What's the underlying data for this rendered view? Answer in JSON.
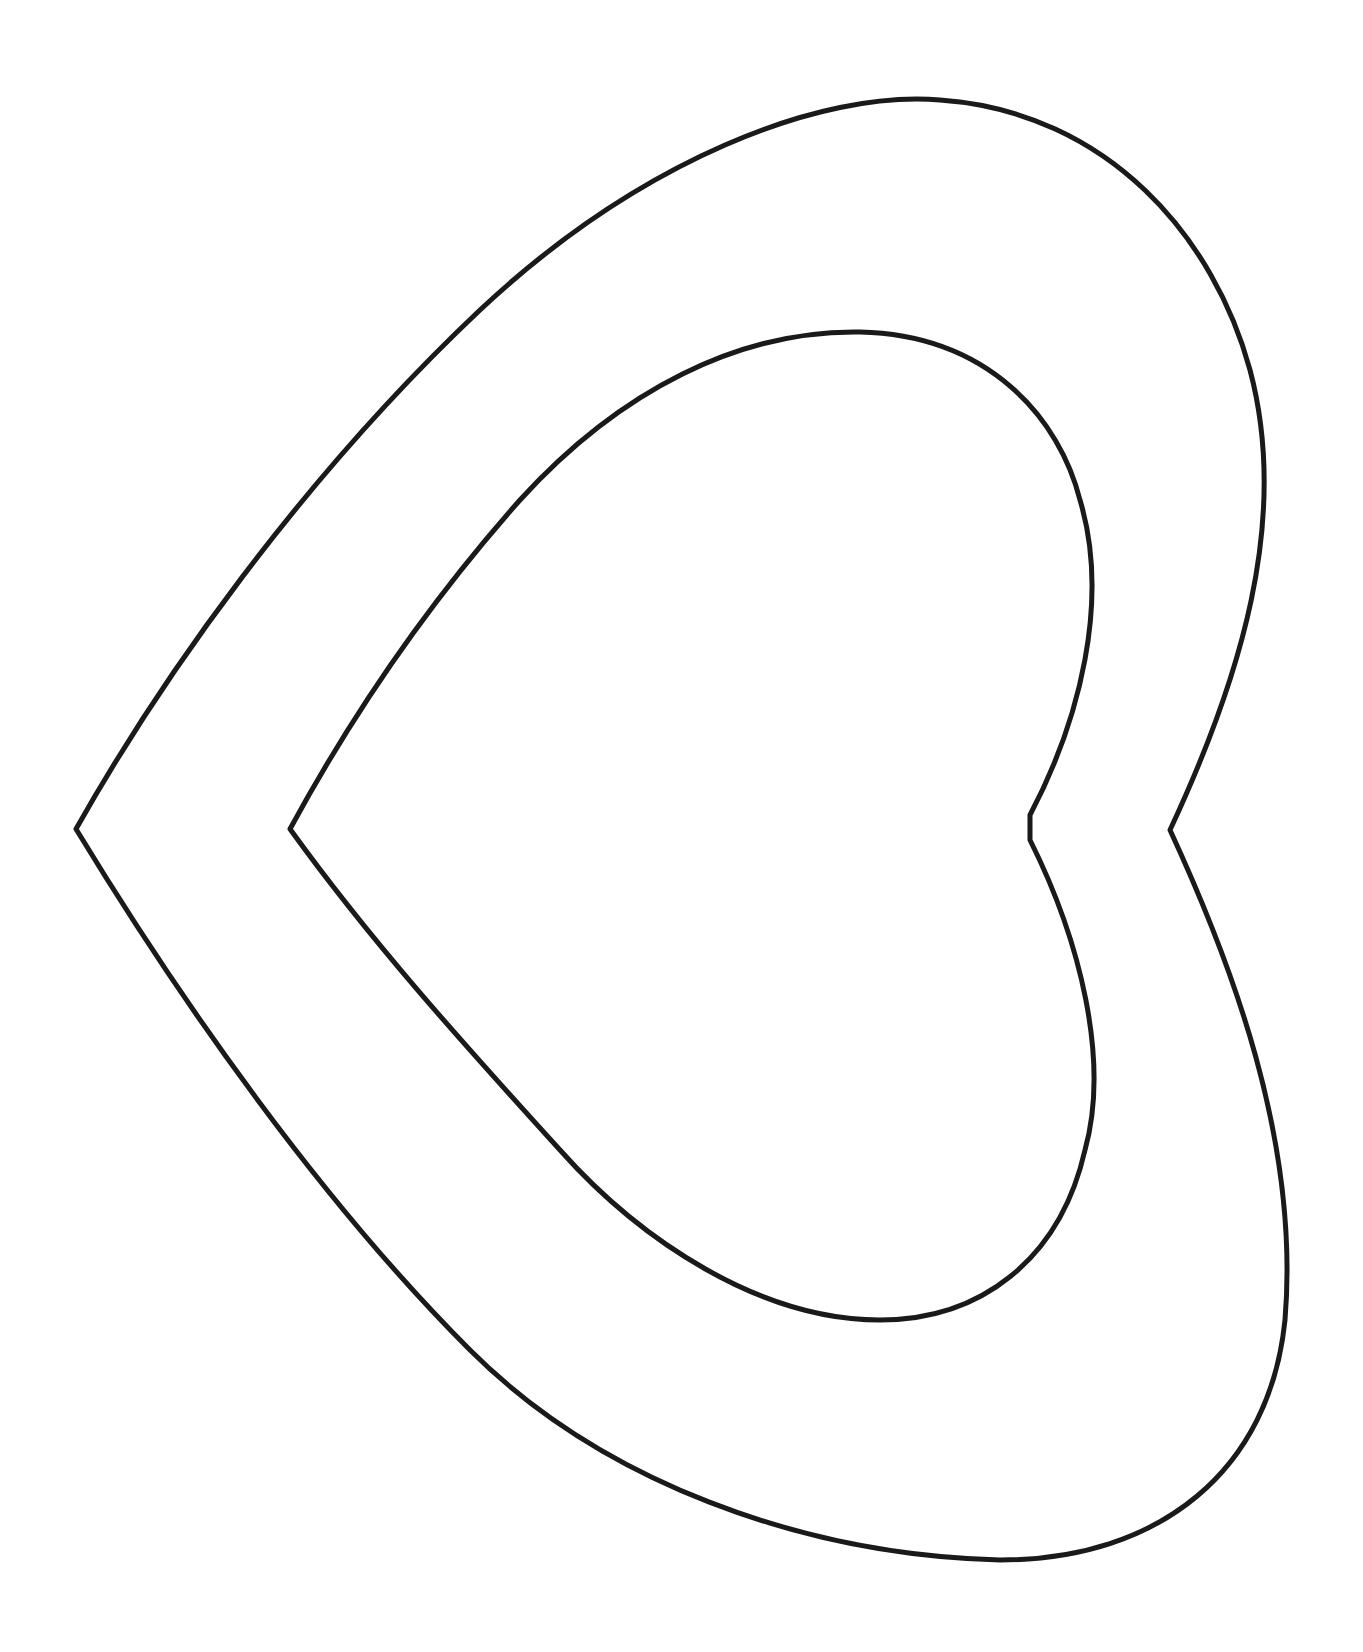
{
  "drawing": {
    "subject": "nested heart outlines",
    "orientation": "rotated, point facing left",
    "stroke_color": "#1a1a1a",
    "background_color": "#ffffff",
    "shapes": [
      {
        "name": "outer-heart"
      },
      {
        "name": "inner-heart"
      }
    ]
  }
}
